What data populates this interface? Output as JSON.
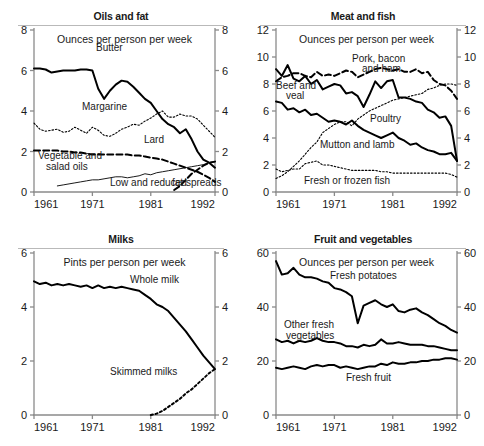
{
  "figure": {
    "caption": "Household food consumption in Great Britain, 1961-1992",
    "panel_count": 4
  },
  "chart_data": [
    {
      "type": "line",
      "title": "Oils and fat",
      "subtitle": "Ounces per person per week",
      "xlabel": "",
      "ylabel": "Ounces per person per week",
      "xlim": [
        1961,
        1992
      ],
      "ylim": [
        0,
        8
      ],
      "yticks": [
        0,
        2,
        4,
        6,
        8
      ],
      "xticks": [
        1961,
        1971,
        1981,
        1992
      ],
      "grid": false,
      "legend_position": "inline-annotations",
      "dual_y_axis": true,
      "x": [
        1961,
        1962,
        1963,
        1964,
        1965,
        1966,
        1967,
        1968,
        1969,
        1970,
        1971,
        1972,
        1973,
        1974,
        1975,
        1976,
        1977,
        1978,
        1979,
        1980,
        1981,
        1982,
        1983,
        1984,
        1985,
        1986,
        1987,
        1988,
        1989,
        1990,
        1991,
        1992
      ],
      "series": [
        {
          "name": "Butter",
          "style": "solid-thick",
          "values": [
            6.1,
            6.1,
            6.05,
            5.9,
            5.95,
            6.0,
            6.0,
            6.0,
            6.05,
            6.05,
            6.0,
            5.1,
            4.6,
            5.0,
            5.3,
            5.5,
            5.45,
            5.2,
            4.9,
            4.6,
            4.4,
            4.0,
            3.6,
            3.35,
            3.2,
            2.9,
            3.1,
            2.6,
            2.0,
            1.6,
            1.45,
            1.2
          ]
        },
        {
          "name": "Margarine",
          "style": "dotted",
          "values": [
            3.4,
            3.1,
            3.0,
            3.05,
            3.1,
            2.95,
            3.0,
            3.2,
            3.05,
            2.9,
            3.2,
            3.05,
            2.8,
            2.75,
            2.9,
            3.1,
            3.2,
            3.35,
            3.3,
            3.5,
            3.65,
            3.85,
            4.0,
            3.7,
            3.7,
            3.85,
            3.75,
            3.75,
            3.6,
            3.3,
            3.0,
            2.7
          ]
        },
        {
          "name": "Lard",
          "style": "dashed-thick",
          "values": [
            2.05,
            2.05,
            2.05,
            2.05,
            2.05,
            2.0,
            2.0,
            1.95,
            1.95,
            1.9,
            1.85,
            1.85,
            1.85,
            1.85,
            1.85,
            1.85,
            1.85,
            1.8,
            1.8,
            1.75,
            1.7,
            1.65,
            1.6,
            1.5,
            1.4,
            1.3,
            1.2,
            1.1,
            1.0,
            0.85,
            0.7,
            0.5
          ]
        },
        {
          "name": "Vegetable and salad oils",
          "style": "solid-thin",
          "values": [
            null,
            null,
            null,
            null,
            0.3,
            0.35,
            0.4,
            0.45,
            0.5,
            0.55,
            0.6,
            0.6,
            0.65,
            0.7,
            0.75,
            0.75,
            0.7,
            0.75,
            0.8,
            0.9,
            0.85,
            0.95,
            1.0,
            1.05,
            1.1,
            1.15,
            1.2,
            1.25,
            1.3,
            1.35,
            1.45,
            1.5
          ]
        },
        {
          "name": "Low and reduced fat spreads",
          "style": "dashed-thick",
          "values": [
            null,
            null,
            null,
            null,
            null,
            null,
            null,
            null,
            null,
            null,
            null,
            null,
            null,
            null,
            null,
            null,
            null,
            null,
            null,
            null,
            null,
            null,
            null,
            null,
            0.1,
            0.3,
            0.6,
            0.9,
            1.1,
            1.3,
            1.45,
            1.5
          ]
        }
      ]
    },
    {
      "type": "line",
      "title": "Meat and fish",
      "subtitle": "Ounces per person per week",
      "xlabel": "",
      "ylabel": "Ounces per person per week",
      "xlim": [
        1961,
        1992
      ],
      "ylim": [
        0,
        12
      ],
      "yticks": [
        0,
        2,
        4,
        6,
        8,
        10,
        12
      ],
      "xticks": [
        1961,
        1971,
        1981,
        1992
      ],
      "grid": false,
      "legend_position": "inline-annotations",
      "dual_y_axis": true,
      "x": [
        1961,
        1962,
        1963,
        1964,
        1965,
        1966,
        1967,
        1968,
        1969,
        1970,
        1971,
        1972,
        1973,
        1974,
        1975,
        1976,
        1977,
        1978,
        1979,
        1980,
        1981,
        1982,
        1983,
        1984,
        1985,
        1986,
        1987,
        1988,
        1989,
        1990,
        1991,
        1992
      ],
      "series": [
        {
          "name": "Pork, bacon and ham",
          "style": "dashed-thick",
          "values": [
            8.2,
            8.5,
            8.6,
            8.8,
            8.8,
            8.6,
            8.5,
            8.9,
            8.6,
            8.7,
            8.6,
            8.8,
            9.0,
            8.9,
            8.5,
            8.7,
            8.9,
            9.1,
            9.2,
            9.1,
            9.0,
            9.1,
            8.9,
            8.9,
            9.1,
            8.8,
            8.9,
            8.3,
            8.0,
            7.9,
            7.5,
            6.9
          ]
        },
        {
          "name": "Beef and veal",
          "style": "solid-thick",
          "values": [
            9.1,
            8.6,
            9.4,
            8.4,
            8.2,
            8.6,
            8.0,
            8.3,
            7.6,
            7.8,
            8.0,
            7.9,
            7.3,
            7.4,
            7.1,
            6.3,
            7.2,
            8.2,
            7.7,
            8.2,
            8.3,
            7.0,
            7.0,
            6.9,
            6.7,
            6.6,
            6.1,
            5.9,
            5.5,
            5.6,
            4.9,
            2.3
          ]
        },
        {
          "name": "Poultry",
          "style": "dotted",
          "values": [
            1.0,
            1.2,
            1.5,
            1.9,
            2.3,
            2.8,
            3.3,
            3.7,
            4.4,
            4.7,
            5.0,
            5.2,
            5.2,
            4.9,
            5.4,
            5.7,
            6.0,
            6.2,
            6.4,
            6.6,
            6.8,
            6.9,
            7.0,
            7.1,
            7.2,
            7.3,
            7.6,
            7.7,
            7.9,
            8.0,
            8.0,
            7.9
          ]
        },
        {
          "name": "Mutton and lamb",
          "style": "solid-thick",
          "values": [
            6.7,
            6.6,
            6.1,
            6.2,
            5.9,
            6.1,
            5.7,
            5.8,
            5.5,
            5.2,
            5.3,
            5.2,
            5.0,
            5.3,
            4.9,
            4.6,
            4.4,
            4.2,
            4.0,
            4.2,
            4.4,
            4.0,
            3.8,
            3.5,
            3.6,
            3.3,
            3.1,
            3.0,
            2.8,
            2.8,
            2.9,
            2.3
          ]
        },
        {
          "name": "Fresh or frozen fish",
          "style": "dotted",
          "values": [
            1.7,
            1.5,
            1.6,
            1.7,
            1.7,
            2.1,
            2.2,
            2.3,
            2.0,
            2.0,
            1.9,
            1.8,
            1.7,
            1.6,
            1.6,
            1.6,
            1.6,
            1.6,
            1.5,
            1.5,
            1.4,
            1.4,
            1.4,
            1.4,
            1.4,
            1.4,
            1.4,
            1.4,
            1.4,
            1.4,
            1.3,
            1.1
          ]
        }
      ]
    },
    {
      "type": "line",
      "title": "Milks",
      "subtitle": "Pints per person per week",
      "xlabel": "",
      "ylabel": "Pints per person per week",
      "xlim": [
        1961,
        1992
      ],
      "ylim": [
        0,
        6
      ],
      "yticks": [
        0,
        2,
        4,
        6
      ],
      "xticks": [
        1961,
        1971,
        1981,
        1992
      ],
      "grid": false,
      "legend_position": "inline-annotations",
      "dual_y_axis": true,
      "x": [
        1961,
        1962,
        1963,
        1964,
        1965,
        1966,
        1967,
        1968,
        1969,
        1970,
        1971,
        1972,
        1973,
        1974,
        1975,
        1976,
        1977,
        1978,
        1979,
        1980,
        1981,
        1982,
        1983,
        1984,
        1985,
        1986,
        1987,
        1988,
        1989,
        1990,
        1991,
        1992
      ],
      "series": [
        {
          "name": "Whole milk",
          "style": "solid-thick",
          "values": [
            4.95,
            4.85,
            4.9,
            4.8,
            4.85,
            4.8,
            4.85,
            4.8,
            4.75,
            4.8,
            4.7,
            4.8,
            4.7,
            4.75,
            4.7,
            4.75,
            4.7,
            4.65,
            4.6,
            4.45,
            4.3,
            4.1,
            4.0,
            3.85,
            3.6,
            3.35,
            3.1,
            2.8,
            2.5,
            2.2,
            1.95,
            1.7
          ]
        },
        {
          "name": "Skimmed milks",
          "style": "dotted-thick",
          "values": [
            null,
            null,
            null,
            null,
            null,
            null,
            null,
            null,
            null,
            null,
            null,
            null,
            null,
            null,
            null,
            null,
            null,
            null,
            null,
            null,
            0.0,
            0.05,
            0.15,
            0.3,
            0.45,
            0.6,
            0.8,
            0.95,
            1.15,
            1.35,
            1.55,
            1.7
          ]
        }
      ]
    },
    {
      "type": "line",
      "title": "Fruit and vegetables",
      "subtitle": "Ounces per person per week",
      "xlabel": "",
      "ylabel": "Ounces per person per week",
      "xlim": [
        1961,
        1992
      ],
      "ylim": [
        0,
        60
      ],
      "yticks": [
        0,
        20,
        40,
        60
      ],
      "xticks": [
        1961,
        1971,
        1981,
        1992
      ],
      "grid": false,
      "legend_position": "inline-annotations",
      "dual_y_axis": true,
      "x": [
        1961,
        1962,
        1963,
        1964,
        1965,
        1966,
        1967,
        1968,
        1969,
        1970,
        1971,
        1972,
        1973,
        1974,
        1975,
        1976,
        1977,
        1978,
        1979,
        1980,
        1981,
        1982,
        1983,
        1984,
        1985,
        1986,
        1987,
        1988,
        1989,
        1990,
        1991,
        1992
      ],
      "series": [
        {
          "name": "Fresh potatoes",
          "style": "solid-thick",
          "values": [
            57.0,
            52.0,
            52.5,
            54.5,
            52.0,
            51.0,
            51.0,
            50.5,
            49.5,
            49.0,
            47.0,
            46.5,
            45.5,
            44.0,
            34.0,
            40.5,
            41.5,
            42.5,
            41.0,
            40.0,
            41.0,
            38.5,
            38.0,
            39.0,
            39.5,
            38.0,
            37.0,
            35.5,
            34.0,
            33.0,
            31.5,
            30.5
          ]
        },
        {
          "name": "Other fresh vegetables",
          "style": "solid-thick",
          "values": [
            28.0,
            27.0,
            27.5,
            26.5,
            27.5,
            27.0,
            27.5,
            28.5,
            27.5,
            27.0,
            27.0,
            26.5,
            25.5,
            25.5,
            25.0,
            26.0,
            25.5,
            26.0,
            28.0,
            26.5,
            26.5,
            27.0,
            26.5,
            26.0,
            26.0,
            26.0,
            25.5,
            25.5,
            25.0,
            24.5,
            24.0,
            24.0
          ]
        },
        {
          "name": "Fresh fruit",
          "style": "solid-thick",
          "values": [
            17.5,
            17.0,
            17.5,
            18.0,
            17.5,
            17.0,
            18.0,
            18.5,
            18.0,
            18.5,
            18.5,
            17.5,
            18.0,
            17.5,
            17.0,
            17.5,
            18.0,
            18.0,
            19.0,
            18.5,
            19.5,
            19.0,
            19.0,
            19.5,
            19.5,
            20.0,
            20.0,
            20.5,
            20.5,
            21.0,
            21.0,
            20.5
          ]
        }
      ]
    }
  ],
  "panels": [
    {
      "id": "oils-and-fat",
      "title": "Oils and fat",
      "subtitle": "Ounces per person per week",
      "y_left_ticks": [
        "8",
        "6",
        "4",
        "2",
        "0"
      ],
      "y_right_ticks": [
        "8",
        "6",
        "4",
        "2",
        "0"
      ],
      "x_ticks": [
        "1961",
        "1971",
        "1981",
        "1992"
      ],
      "annotations": [
        {
          "text": "Butter",
          "x": 96,
          "y": 51
        },
        {
          "text": "Margarine",
          "x": 82,
          "y": 110
        },
        {
          "text": "Lard",
          "x": 144,
          "y": 143
        },
        {
          "text": "Vegetable and",
          "x": 38,
          "y": 159
        },
        {
          "text": "salad oils",
          "x": 46,
          "y": 170
        },
        {
          "text": "Low and reduced",
          "x": 110,
          "y": 186
        },
        {
          "text": "fat spreads",
          "x": 172,
          "y": 186
        }
      ]
    },
    {
      "id": "meat-and-fish",
      "title": "Meat and fish",
      "subtitle": "Ounces per person per week",
      "y_left_ticks": [
        "12",
        "10",
        "8",
        "6",
        "4",
        "2",
        "0"
      ],
      "y_right_ticks": [
        "12",
        "10",
        "8",
        "6",
        "4",
        "2",
        "0"
      ],
      "x_ticks": [
        "1961",
        "1971",
        "1981",
        "1992"
      ],
      "annotations": [
        {
          "text": "Pork, bacon",
          "x": 110,
          "y": 62
        },
        {
          "text": "and ham",
          "x": 120,
          "y": 72
        },
        {
          "text": "Beef and",
          "x": 34,
          "y": 89
        },
        {
          "text": "veal",
          "x": 44,
          "y": 99
        },
        {
          "text": "Poultry",
          "x": 128,
          "y": 122
        },
        {
          "text": "Mutton and lamb",
          "x": 78,
          "y": 148
        },
        {
          "text": "Fresh or frozen fish",
          "x": 62,
          "y": 184
        }
      ]
    },
    {
      "id": "milks",
      "title": "Milks",
      "subtitle": "Pints per person per week",
      "y_left_ticks": [
        "6",
        "4",
        "2",
        "0"
      ],
      "y_right_ticks": [
        "6",
        "4",
        "2",
        "0"
      ],
      "x_ticks": [
        "1961",
        "1971",
        "1981",
        "1992"
      ],
      "annotations": [
        {
          "text": "Whole milk",
          "x": 130,
          "y": 60
        },
        {
          "text": "Skimmed milks",
          "x": 110,
          "y": 152
        }
      ]
    },
    {
      "id": "fruit-and-vegetables",
      "title": "Fruit and vegetables",
      "subtitle": "Ounces per person per week",
      "y_left_ticks": [
        "60",
        "40",
        "20",
        "0"
      ],
      "y_right_ticks": [
        "60",
        "40",
        "20",
        "0"
      ],
      "x_ticks": [
        "1961",
        "1971",
        "1981",
        "1992"
      ],
      "annotations": [
        {
          "text": "Fresh potatoes",
          "x": 88,
          "y": 56
        },
        {
          "text": "Other fresh",
          "x": 42,
          "y": 105
        },
        {
          "text": "vegetables",
          "x": 44,
          "y": 116
        },
        {
          "text": "Fresh fruit",
          "x": 104,
          "y": 158
        }
      ]
    }
  ],
  "colors": {
    "ink": "#000000",
    "axis": "#8a8a8a",
    "text": "#1a1a1a",
    "background": "#ffffff"
  }
}
